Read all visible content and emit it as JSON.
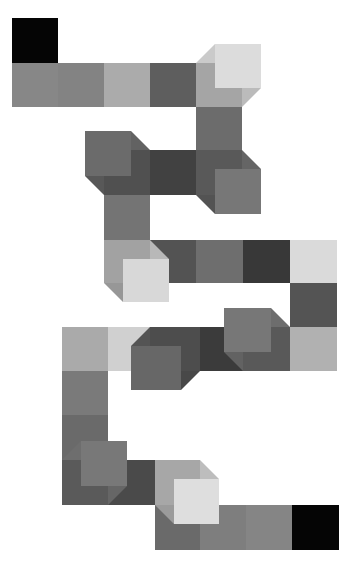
{
  "puzzle": {
    "title": "Cube path",
    "start_color": "#000000",
    "end_color": "#000000",
    "tiles": [
      {
        "id": "start",
        "kind": "flat",
        "color": "#050505"
      },
      {
        "id": "t1",
        "kind": "flat",
        "color": "#878787"
      },
      {
        "id": "t2",
        "kind": "flat",
        "color": "#838383"
      },
      {
        "id": "t3",
        "kind": "flat",
        "color": "#ababab"
      },
      {
        "id": "t4",
        "kind": "flat",
        "color": "#5e5e5e"
      },
      {
        "id": "c1",
        "kind": "cube",
        "color": "#dcdcdc",
        "extrude": "up-right"
      },
      {
        "id": "t5",
        "kind": "flat",
        "color": "#6c6c6c"
      },
      {
        "id": "c2",
        "kind": "cube",
        "color": "#777777",
        "extrude": "down-right"
      },
      {
        "id": "t6",
        "kind": "flat",
        "color": "#414141"
      },
      {
        "id": "c3",
        "kind": "cube",
        "color": "#6b6b6b",
        "extrude": "up-left"
      },
      {
        "id": "t7",
        "kind": "flat",
        "color": "#747474"
      },
      {
        "id": "c4",
        "kind": "cube",
        "color": "#d8d8d8",
        "extrude": "down-right"
      },
      {
        "id": "t8",
        "kind": "flat",
        "color": "#535353"
      },
      {
        "id": "t9",
        "kind": "flat",
        "color": "#6e6e6e"
      },
      {
        "id": "t10",
        "kind": "flat",
        "color": "#383838"
      },
      {
        "id": "t11",
        "kind": "flat",
        "color": "#dadada"
      },
      {
        "id": "t12",
        "kind": "flat",
        "color": "#545454"
      },
      {
        "id": "t13",
        "kind": "flat",
        "color": "#b1b1b1"
      },
      {
        "id": "c5",
        "kind": "cube",
        "color": "#777777",
        "extrude": "up-left"
      },
      {
        "id": "t14",
        "kind": "flat",
        "color": "#3b3b3b"
      },
      {
        "id": "c6",
        "kind": "cube",
        "color": "#676767",
        "extrude": "down-left"
      },
      {
        "id": "t15",
        "kind": "flat",
        "color": "#d0d0d0"
      },
      {
        "id": "t16",
        "kind": "flat",
        "color": "#aaaaaa"
      },
      {
        "id": "t17",
        "kind": "flat",
        "color": "#7a7a7a"
      },
      {
        "id": "t18",
        "kind": "flat",
        "color": "#6a6a6a"
      },
      {
        "id": "c7",
        "kind": "cube",
        "color": "#787878",
        "extrude": "up-right"
      },
      {
        "id": "t19",
        "kind": "flat",
        "color": "#4a4a4a"
      },
      {
        "id": "c8",
        "kind": "cube",
        "color": "#dedede",
        "extrude": "down-right"
      },
      {
        "id": "t20",
        "kind": "flat",
        "color": "#6a6a6a"
      },
      {
        "id": "t21",
        "kind": "flat",
        "color": "#7e7e7e"
      },
      {
        "id": "t22",
        "kind": "flat",
        "color": "#858585"
      },
      {
        "id": "end",
        "kind": "flat",
        "color": "#050505"
      }
    ]
  }
}
